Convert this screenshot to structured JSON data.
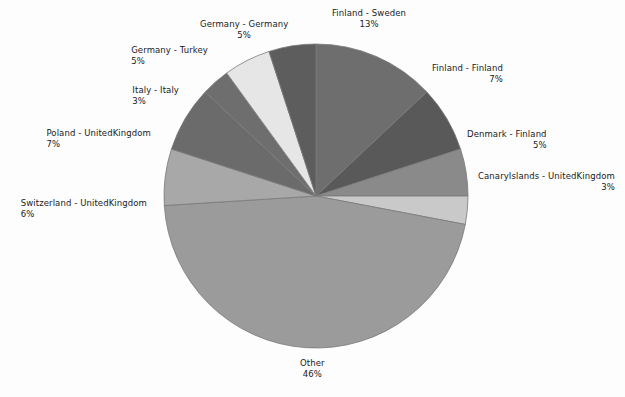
{
  "chart_data": {
    "type": "pie",
    "title": "",
    "subtitle": "",
    "xlabel": "",
    "ylabel": "",
    "legend_position": "none",
    "grid": false,
    "start_angle_deg": 0,
    "direction": "clockwise",
    "categories": [
      "Finland - Sweden",
      "Finland - Finland",
      "Denmark - Finland",
      "CanaryIslands - UnitedKingdom",
      "Other",
      "Switzerland - UnitedKingdom",
      "Poland - UnitedKingdom",
      "Italy - Italy",
      "Germany - Turkey",
      "Germany - Germany"
    ],
    "values": [
      13,
      7,
      5,
      3,
      46,
      6,
      7,
      3,
      5,
      5
    ],
    "value_labels": [
      "13%",
      "7%",
      "5%",
      "3%",
      "46%",
      "6%",
      "7%",
      "3%",
      "5%",
      "5%"
    ],
    "colors": [
      "#6e6e6e",
      "#595959",
      "#8a8a8a",
      "#c9c9c9",
      "#9b9b9b",
      "#a8a8a8",
      "#6b6b6b",
      "#6e6e6e",
      "#e6e6e6",
      "#5d5d5d"
    ],
    "slices": [
      {
        "name": "Finland - Sweden",
        "value": 13,
        "pct_label": "13%",
        "color": "#6e6e6e"
      },
      {
        "name": "Finland - Finland",
        "value": 7,
        "pct_label": "7%",
        "color": "#595959"
      },
      {
        "name": "Denmark - Finland",
        "value": 5,
        "pct_label": "5%",
        "color": "#8a8a8a"
      },
      {
        "name": "CanaryIslands - UnitedKingdom",
        "value": 3,
        "pct_label": "3%",
        "color": "#c9c9c9"
      },
      {
        "name": "Other",
        "value": 46,
        "pct_label": "46%",
        "color": "#9b9b9b"
      },
      {
        "name": "Switzerland - UnitedKingdom",
        "value": 6,
        "pct_label": "6%",
        "color": "#a8a8a8"
      },
      {
        "name": "Poland - UnitedKingdom",
        "value": 7,
        "pct_label": "7%",
        "color": "#6b6b6b"
      },
      {
        "name": "Italy - Italy",
        "value": 3,
        "pct_label": "3%",
        "color": "#6e6e6e"
      },
      {
        "name": "Germany - Turkey",
        "value": 5,
        "pct_label": "5%",
        "color": "#e6e6e6"
      },
      {
        "name": "Germany - Germany",
        "value": 5,
        "pct_label": "5%",
        "color": "#5d5d5d"
      }
    ]
  },
  "labels": {
    "finland_sweden": {
      "name": "Finland - Sweden",
      "pct": "13%"
    },
    "finland_finland": {
      "name": "Finland - Finland",
      "pct": "7%"
    },
    "denmark_finland": {
      "name": "Denmark - Finland",
      "pct": "5%"
    },
    "canary_uk": {
      "name": "CanaryIslands - UnitedKingdom",
      "pct": "3%"
    },
    "other": {
      "name": "Other",
      "pct": "46%"
    },
    "switzerland_uk": {
      "name": "Switzerland - UnitedKingdom",
      "pct": "6%"
    },
    "poland_uk": {
      "name": "Poland - UnitedKingdom",
      "pct": "7%"
    },
    "italy_italy": {
      "name": "Italy - Italy",
      "pct": "3%"
    },
    "germany_turkey": {
      "name": "Germany - Turkey",
      "pct": "5%"
    },
    "germany_germany": {
      "name": "Germany - Germany",
      "pct": "5%"
    }
  },
  "geometry": {
    "center_x": 316,
    "center_y": 196,
    "radius": 152
  },
  "style": {
    "background": "#fdfdfd",
    "label_color": "#1a1a1a",
    "slice_border": "#7a7a7a"
  }
}
